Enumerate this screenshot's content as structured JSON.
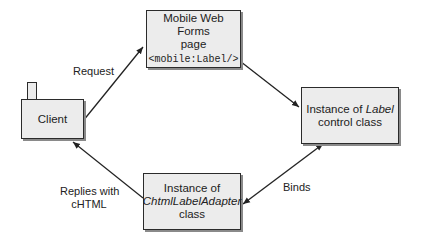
{
  "diagram": {
    "nodes": {
      "client": {
        "label": "Client"
      },
      "page": {
        "line1": "Mobile Web Forms",
        "line2": "page",
        "code": "<mobile:Label/>"
      },
      "label_control": {
        "prefix": "Instance of ",
        "italic": "Label",
        "line2": "control class"
      },
      "adapter": {
        "line1": "Instance of",
        "italic": "ChtmlLabelAdapter",
        "line3": "class"
      }
    },
    "edges": {
      "request": {
        "label": "Request",
        "from": "client",
        "to": "page"
      },
      "page_to_control": {
        "label": "",
        "from": "page",
        "to": "label_control"
      },
      "binds": {
        "label": "Binds",
        "from": "label_control",
        "to": "adapter",
        "bidirectional": true
      },
      "replies": {
        "line1": "Replies with",
        "line2": "cHTML",
        "from": "adapter",
        "to": "client"
      }
    },
    "colors": {
      "box_fill": "#ececec",
      "box_border": "#2b2b2b",
      "shadow": "#8a8a8a",
      "line": "#222222"
    }
  }
}
